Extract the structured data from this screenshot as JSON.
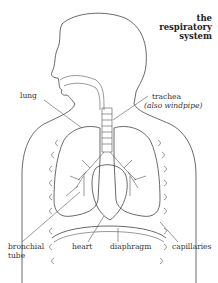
{
  "title": {
    "line1": "the",
    "line2": "respiratory",
    "line3": "system"
  },
  "labels": {
    "lung": "lung",
    "trachea": "trachea",
    "trachea_alt": "(also windpipe)",
    "bronchial_tube_1": "bronchial",
    "bronchial_tube_2": "tube",
    "heart": "heart",
    "diaphragm": "diaphragm",
    "capillaries": "capillaries"
  }
}
